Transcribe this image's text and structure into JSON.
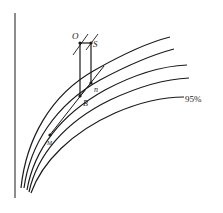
{
  "diagram": {
    "type": "curve-family",
    "labels": {
      "O": "O",
      "S": "S",
      "n": "n",
      "B": "B",
      "M": "M",
      "percent": "95%"
    },
    "curves": [
      {
        "id": "curve-1",
        "label": ""
      },
      {
        "id": "curve-2",
        "label": ""
      },
      {
        "id": "curve-3",
        "label": ""
      },
      {
        "id": "curve-4",
        "label": ""
      },
      {
        "id": "curve-5",
        "label": "95%"
      }
    ],
    "colors": {
      "line": "#1a1a1a",
      "background": "#ffffff"
    }
  }
}
